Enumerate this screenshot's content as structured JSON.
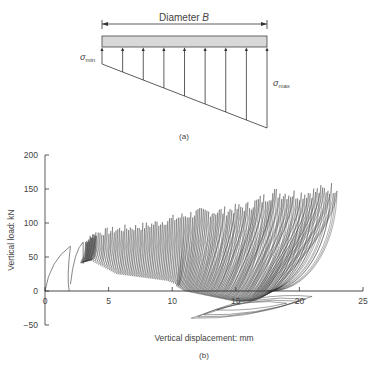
{
  "diagram": {
    "dimension_label": "Diameter B",
    "sigma_min_label": "σ",
    "sigma_min_sub": "min",
    "sigma_max_label": "σ",
    "sigma_max_sub": "max",
    "caption": "(a)",
    "arrow_count": 9
  },
  "chart_data": {
    "type": "line",
    "title": "",
    "caption": "(b)",
    "xlabel": "Vertical displacement: mm",
    "ylabel": "Vertical load: kN",
    "xlim": [
      0,
      25
    ],
    "ylim": [
      -50,
      200
    ],
    "xticks": [
      0,
      5,
      10,
      15,
      20,
      25
    ],
    "yticks": [
      -50,
      0,
      50,
      100,
      150,
      200
    ],
    "grid": false,
    "legend": null,
    "series": [
      {
        "name": "peak load envelope",
        "x": [
          0,
          2,
          3,
          4,
          5,
          6,
          8,
          10,
          12,
          14,
          16,
          18,
          20,
          22,
          23
        ],
        "y": [
          0,
          66,
          72,
          88,
          92,
          95,
          100,
          110,
          120,
          122,
          130,
          150,
          148,
          155,
          160
        ]
      },
      {
        "name": "unloading minimum envelope",
        "x": [
          0,
          2,
          3,
          4,
          6,
          8,
          10,
          12,
          14,
          16,
          18,
          20,
          22
        ],
        "y": [
          0,
          0,
          40,
          45,
          25,
          20,
          15,
          0,
          -5,
          -10,
          -15,
          -15,
          0
        ]
      },
      {
        "name": "negative excursion loops",
        "x": [
          11.5,
          13,
          15,
          17,
          19,
          20
        ],
        "y": [
          -40,
          -35,
          -30,
          -25,
          -20,
          -15
        ]
      }
    ]
  }
}
